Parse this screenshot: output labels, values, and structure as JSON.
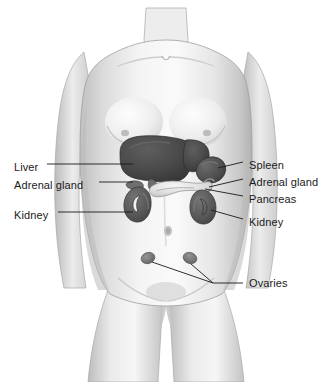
{
  "figure": {
    "background_color": "#ffffff",
    "width": 332,
    "height": 382,
    "style": "grayscale medical illustration with leader-line labels"
  },
  "colors": {
    "background": "#ffffff",
    "skin_light": "#f2f2f2",
    "skin_mid": "#d8d8d8",
    "skin_shadow": "#b4b4b4",
    "outline": "#9a9a9a",
    "liver": "#4a4a4a",
    "spleen": "#545454",
    "kidney": "#5c5c5c",
    "adrenal": "#6a6a6a",
    "pancreas": "#e8e8e8",
    "ovary": "#7a7a7a",
    "leader_line": "#1a1a1a",
    "label_text": "#1a1a1a"
  },
  "labels": {
    "left": [
      {
        "id": "liver",
        "text": "Liver",
        "x": 14,
        "y": 168
      },
      {
        "id": "adrenal-gland-left",
        "text": "Adrenal gland",
        "x": 14,
        "y": 186
      },
      {
        "id": "kidney-left",
        "text": "Kidney",
        "x": 14,
        "y": 216
      }
    ],
    "right": [
      {
        "id": "spleen",
        "text": "Spleen",
        "y": 166
      },
      {
        "id": "adrenal-gland-right",
        "text": "Adrenal gland",
        "y": 183
      },
      {
        "id": "pancreas",
        "text": "Pancreas",
        "y": 200
      },
      {
        "id": "kidney-right",
        "text": "Kidney",
        "y": 223
      },
      {
        "id": "ovaries",
        "text": "Ovaries",
        "y": 284
      }
    ]
  },
  "organs": [
    {
      "id": "liver",
      "name": "Liver",
      "side": "left",
      "shade": "dark",
      "cx": 150,
      "cy": 159
    },
    {
      "id": "spleen",
      "name": "Spleen",
      "side": "right",
      "shade": "dark",
      "cx": 211,
      "cy": 170
    },
    {
      "id": "adrenal-gland-left",
      "name": "Adrenal gland",
      "side": "left",
      "shade": "medium",
      "cx": 134,
      "cy": 182
    },
    {
      "id": "adrenal-gland-right",
      "name": "Adrenal gland",
      "side": "right",
      "shade": "medium",
      "cx": 203,
      "cy": 186
    },
    {
      "id": "pancreas",
      "name": "Pancreas",
      "side": "center",
      "shade": "light",
      "cx": 176,
      "cy": 192
    },
    {
      "id": "kidney-left",
      "name": "Kidney",
      "side": "left",
      "shade": "dark",
      "cx": 136,
      "cy": 203
    },
    {
      "id": "kidney-right",
      "name": "Kidney",
      "side": "right",
      "shade": "dark",
      "cx": 205,
      "cy": 207
    },
    {
      "id": "ovary-left",
      "name": "Ovary",
      "side": "left",
      "shade": "medium",
      "cx": 148,
      "cy": 258
    },
    {
      "id": "ovary-right",
      "name": "Ovary",
      "side": "right",
      "shade": "medium",
      "cx": 190,
      "cy": 258
    }
  ]
}
